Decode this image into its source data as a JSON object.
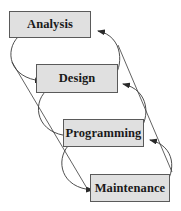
{
  "diagram": {
    "title": "",
    "colors": {
      "box_fill": "#e0e0e0",
      "box_border": "#5a5a5a",
      "line": "#3a3a3a",
      "text": "#1a1a1a"
    },
    "nodes": [
      {
        "id": "analysis",
        "label": "Analysis"
      },
      {
        "id": "design",
        "label": "Design"
      },
      {
        "id": "programming",
        "label": "Programming"
      },
      {
        "id": "maintenance",
        "label": "Maintenance"
      }
    ],
    "edges": [
      {
        "from": "analysis",
        "to": "design",
        "type": "forward-curve"
      },
      {
        "from": "design",
        "to": "programming",
        "type": "forward-curve"
      },
      {
        "from": "programming",
        "to": "maintenance",
        "type": "forward-curve"
      },
      {
        "from": "design",
        "to": "analysis",
        "type": "feedback-curve"
      },
      {
        "from": "programming",
        "to": "design",
        "type": "feedback-curve"
      },
      {
        "from": "maintenance",
        "to": "programming",
        "type": "feedback-curve"
      },
      {
        "from": "analysis",
        "to": "maintenance",
        "type": "boundary-line"
      },
      {
        "from": "maintenance",
        "to": "analysis",
        "type": "boundary-line"
      }
    ]
  }
}
